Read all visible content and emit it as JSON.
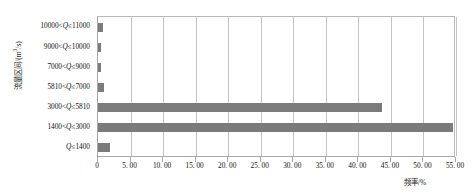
{
  "chart_data": {
    "type": "bar",
    "orientation": "horizontal",
    "title": "",
    "xlabel": "频率/%",
    "ylabel": "流量区间/(m³/s)",
    "categories": [
      "10000<Q≤11000",
      "9000<Q≤10000",
      "7000<Q≤9000",
      "5810<Q≤7000",
      "3000<Q≤5810",
      "1400<Q≤3000",
      "Q≤1400"
    ],
    "values": [
      0.8,
      0.45,
      0.5,
      0.9,
      43.7,
      54.6,
      1.9
    ],
    "xlim": [
      0,
      55
    ],
    "xticks": [
      0,
      5,
      10,
      15,
      20,
      25,
      30,
      35,
      40,
      45,
      50,
      55
    ],
    "xtick_labels": [
      "0",
      "5. 00",
      "10. 00",
      "15. 00",
      "20. 00",
      "25. 00",
      "30. 00",
      "35. 00",
      "40. 00",
      "45. 00",
      "50. 00",
      "55. 00"
    ],
    "grid": true,
    "grid_axis": "x",
    "legend": null,
    "bar_color": "#7b7b7b",
    "grid_color": "#c4c4c4",
    "axis_color": "#a8a8a8",
    "text_color": "#111111"
  },
  "axis_labels": {
    "y_title_main": "流量区间/(m",
    "y_title_sup": "3",
    "y_title_tail": "/s)",
    "x_title": "频率/%"
  },
  "y_tick_labels": [
    {
      "pre": "10000<",
      "var": "Q",
      "post": "≤11000"
    },
    {
      "pre": "9000<",
      "var": "Q",
      "post": "≤10000"
    },
    {
      "pre": "7000<",
      "var": "Q",
      "post": "≤9000"
    },
    {
      "pre": "5810<",
      "var": "Q",
      "post": "≤7000"
    },
    {
      "pre": "3000<",
      "var": "Q",
      "post": "≤5810"
    },
    {
      "pre": "1400<",
      "var": "Q",
      "post": "≤3000"
    },
    {
      "pre": "",
      "var": "Q",
      "post": "≤1400"
    }
  ]
}
